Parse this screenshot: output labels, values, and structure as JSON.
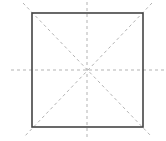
{
  "diagram": {
    "type": "square-with-guidelines",
    "canvas": {
      "width": 166,
      "height": 141,
      "background": "#ffffff"
    },
    "square": {
      "x": 32,
      "y": 13,
      "width": 111,
      "height": 114,
      "stroke": "#444444",
      "stroke_width": 1.6
    },
    "guides": {
      "stroke": "#aaaaaa",
      "stroke_width": 0.9,
      "dasharray": "3,3",
      "lines": [
        {
          "name": "horizontal-center",
          "x1": 11,
          "y1": 70,
          "x2": 164,
          "y2": 70
        },
        {
          "name": "vertical-center",
          "x1": 87,
          "y1": 2,
          "x2": 87,
          "y2": 139
        },
        {
          "name": "diagonal-tl-br",
          "x1": 23,
          "y1": 3,
          "x2": 151,
          "y2": 136
        },
        {
          "name": "diagonal-tr-bl",
          "x1": 152,
          "y1": 3,
          "x2": 24,
          "y2": 137
        }
      ]
    },
    "center": {
      "x": 87,
      "y": 70
    }
  }
}
